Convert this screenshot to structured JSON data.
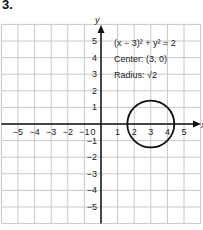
{
  "problem_number": "3.",
  "chart_data": {
    "type": "line",
    "title": "",
    "xlabel": "x",
    "ylabel": "y",
    "xlim": [
      -6,
      6
    ],
    "ylim": [
      -6,
      6
    ],
    "grid": true,
    "x_ticks": [
      "-5",
      "-4",
      "-3",
      "-2",
      "-1",
      "0",
      "1",
      "2",
      "3",
      "4",
      "5"
    ],
    "y_ticks": [
      "5",
      "4",
      "3",
      "2",
      "1",
      "-1",
      "-2",
      "-3",
      "-4",
      "-5"
    ],
    "series": [
      {
        "name": "circle",
        "shape": "circle",
        "center": [
          3,
          0
        ],
        "radius": 1.414
      }
    ],
    "annotations": [
      "(x − 3)² + y² = 2",
      "Center: (3, 0)",
      "Radius: √2"
    ]
  },
  "labels": {
    "equation": "(x − 3)² + y² = 2",
    "center": "Center: (3, 0)",
    "radius": "Radius: √2",
    "x_axis": "x",
    "y_axis": "y"
  },
  "colors": {
    "grid": "#c8c8c8",
    "axis": "#111111",
    "circle": "#111111"
  }
}
